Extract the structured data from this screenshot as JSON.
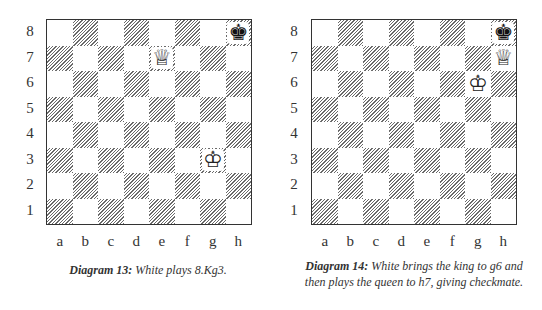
{
  "files": [
    "a",
    "b",
    "c",
    "d",
    "e",
    "f",
    "g",
    "h"
  ],
  "ranks": [
    "8",
    "7",
    "6",
    "5",
    "4",
    "3",
    "2",
    "1"
  ],
  "diagrams": [
    {
      "label": "Diagram 13:",
      "caption": " White plays 8.Kg3.",
      "pieces": [
        {
          "square": "h8",
          "piece": "king",
          "color": "black",
          "glyph": "♚"
        },
        {
          "square": "e7",
          "piece": "queen",
          "color": "white",
          "glyph": "♕"
        },
        {
          "square": "g3",
          "piece": "king",
          "color": "white",
          "glyph": "♔"
        }
      ]
    },
    {
      "label": "Diagram 14:",
      "caption": " White brings the king to g6 and then plays the queen to h7, giving checkmate.",
      "pieces": [
        {
          "square": "h8",
          "piece": "king",
          "color": "black",
          "glyph": "♚"
        },
        {
          "square": "h7",
          "piece": "queen",
          "color": "white",
          "glyph": "♕"
        },
        {
          "square": "g6",
          "piece": "king",
          "color": "white",
          "glyph": "♔"
        }
      ]
    }
  ],
  "colors": {
    "dark_hatch": "#6a6a6a",
    "light": "#ffffff",
    "border": "#333333"
  }
}
